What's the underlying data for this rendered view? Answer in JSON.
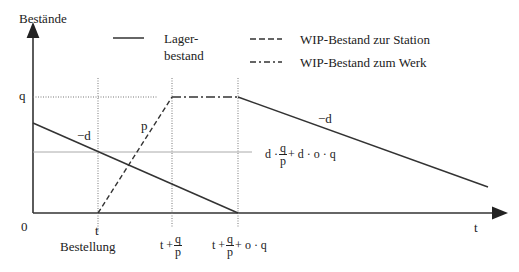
{
  "diagram": {
    "y_axis_label": "Bestände",
    "x_axis_label": "t",
    "origin_label": "0",
    "y_tick_q": "q",
    "legend": [
      {
        "style": "solid",
        "label_line1": "Lager-",
        "label_line2": "bestand"
      },
      {
        "style": "dashed",
        "label": "WIP-Bestand zur Station"
      },
      {
        "style": "dash-dot",
        "label": "WIP-Bestand zum Werk"
      }
    ],
    "x_ticks": {
      "t": {
        "label": "t",
        "sublabel": "Bestellung"
      },
      "t_plus_q_over_p": {
        "prefix": "t + ",
        "num": "q",
        "den": "p",
        "suffix": ""
      },
      "t_plus_q_over_p_plus_oq": {
        "prefix": "t + ",
        "num": "q",
        "den": "p",
        "suffix": "+ o · q"
      }
    },
    "slope_labels": {
      "lager_left": "−d",
      "wip_rise": "p",
      "lager_right": "−d"
    },
    "level_label": {
      "prefix": "d · ",
      "num": "q",
      "den": "p",
      "suffix": "+ d · o · q"
    },
    "colors": {
      "line": "#333333",
      "grid": "#888888"
    }
  }
}
